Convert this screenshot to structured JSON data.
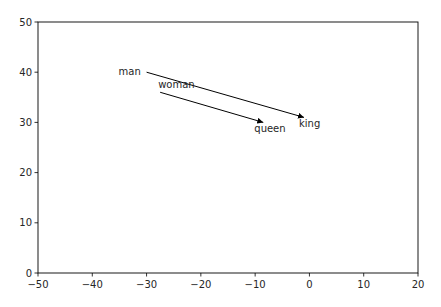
{
  "chart_data": {
    "type": "scatter",
    "title": "",
    "xlabel": "",
    "ylabel": "",
    "xlim": [
      -50,
      20
    ],
    "ylim": [
      0,
      50
    ],
    "grid": false,
    "xticks": [
      -50,
      -40,
      -30,
      -20,
      -10,
      0,
      10,
      20
    ],
    "yticks": [
      0,
      10,
      20,
      30,
      40,
      50
    ],
    "xtick_labels": [
      "−50",
      "−40",
      "−30",
      "−20",
      "−10",
      "0",
      "10",
      "20"
    ],
    "ytick_labels": [
      "0",
      "10",
      "20",
      "30",
      "40",
      "50"
    ],
    "annotations": [
      {
        "text": "man",
        "x": -30,
        "y": 40
      },
      {
        "text": "woman",
        "x": -27.5,
        "y": 36
      },
      {
        "text": "king",
        "x": -1,
        "y": 31
      },
      {
        "text": "queen",
        "x": -8.5,
        "y": 30
      }
    ],
    "arrows": [
      {
        "from": "man",
        "to": "king",
        "x0": -30,
        "y0": 40,
        "x1": -1,
        "y1": 31
      },
      {
        "from": "woman",
        "to": "queen",
        "x0": -27.5,
        "y0": 36,
        "x1": -8.5,
        "y1": 30
      }
    ]
  }
}
